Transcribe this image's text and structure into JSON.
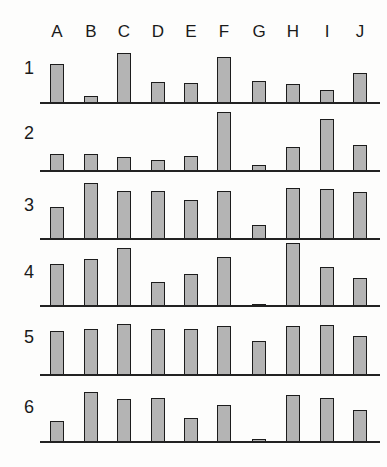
{
  "chart_data": {
    "type": "bar",
    "title": "",
    "xlabel": "",
    "ylabel": "",
    "layout": "small multiples: 6 rows of bar charts sharing columns A-J, no axes ticks, no gridlines",
    "categories": [
      "A",
      "B",
      "C",
      "D",
      "E",
      "F",
      "G",
      "H",
      "I",
      "J"
    ],
    "units": "approximate bar height in pixels (relative scale)",
    "ylim": [
      0,
      62
    ],
    "series": [
      {
        "name": "1",
        "values": [
          38,
          6,
          49,
          20,
          19,
          45,
          21,
          18,
          12,
          29
        ]
      },
      {
        "name": "2",
        "values": [
          16,
          16,
          13,
          10,
          14,
          58,
          5,
          23,
          51,
          25
        ]
      },
      {
        "name": "3",
        "values": [
          31,
          55,
          47,
          47,
          38,
          47,
          13,
          50,
          49,
          46
        ]
      },
      {
        "name": "4",
        "values": [
          41,
          46,
          57,
          23,
          31,
          48,
          1,
          62,
          38,
          27
        ]
      },
      {
        "name": "5",
        "values": [
          43,
          45,
          50,
          45,
          45,
          48,
          33,
          48,
          49,
          38
        ]
      },
      {
        "name": "6",
        "values": [
          20,
          49,
          42,
          43,
          23,
          36,
          2,
          46,
          43,
          31
        ]
      }
    ]
  },
  "column_labels": [
    "A",
    "B",
    "C",
    "D",
    "E",
    "F",
    "G",
    "H",
    "I",
    "J"
  ],
  "row_labels": [
    "1",
    "2",
    "3",
    "4",
    "5",
    "6"
  ],
  "style": {
    "bar_fill": "#b4b4b4",
    "bar_stroke": "#1c1c1c",
    "background": "#fdfdfc"
  }
}
